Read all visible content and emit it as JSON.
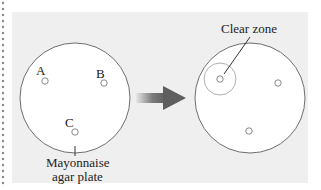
{
  "diagram": {
    "before_plate": {
      "caption_line1": "Mayonnaise",
      "caption_line2": "agar plate",
      "colonies": [
        {
          "label": "A"
        },
        {
          "label": "B"
        },
        {
          "label": "C"
        }
      ]
    },
    "after_plate": {
      "annotation": "Clear zone",
      "colony_count": 3
    },
    "arrow": {
      "direction": "right",
      "meaning": "incubation result"
    },
    "colors": {
      "panel_bg": "#efefef",
      "plate_fill": "#ffffff",
      "plate_stroke": "#6e6e6e",
      "colony_stroke": "#8a8a8a",
      "clear_zone_stroke": "#b0b0b0",
      "arrow": "#6a6a6a",
      "text": "#222222",
      "border_dots": "#888888"
    }
  }
}
